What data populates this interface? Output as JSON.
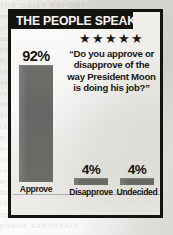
{
  "headline": "THE PEOPLE SPEAK",
  "rating": {
    "icon": "star-icon",
    "count": 5,
    "glyphs": "★★★★★"
  },
  "quote": "“Do you approve or disapprove of the way President Moon is doing his job?”",
  "colors": {
    "frame": "#15130f",
    "headline_bar": "#14120e",
    "headline_text": "#fbfaf7",
    "bar_fill": "#6a6a66",
    "paper": "#eceae6",
    "ink": "#17150f"
  },
  "bleed_lines": [
    "THE DAILY REPORT",
    "an  urgent  notice",
    "of  the  committee",
    "see  back  page  for",
    "continued  coverage",
    "NATIONAL  EDITION",
    "the  people  speak",
    "approval  ratings",
    "record  high  marks",
    "editorial  opinion",
    "city  desk  bulletin",
    "late  final  edition",
    "market  wrap  up",
    "weather  and  sports",
    "classified  section",
    "letters  to  editor",
    "world  news  digest",
    "business  section  b",
    "the  morning  news",
    "special  report  now",
    "public  confidence"
  ],
  "chart_data": {
    "type": "bar",
    "title": "THE PEOPLE SPEAK",
    "subtitle": "“Do you approve or disapprove of the way President Moon is doing his job?”",
    "xlabel": "",
    "ylabel": "",
    "ylim": [
      0,
      100
    ],
    "grid": false,
    "legend": "none",
    "unit": "%",
    "categories": [
      "Approve",
      "Disapprove",
      "Undecided"
    ],
    "values": [
      92,
      4,
      4
    ],
    "data_labels": [
      "92%",
      "4%",
      "4%"
    ],
    "bars": [
      {
        "label": "Approve",
        "value": 92,
        "display": "92%"
      },
      {
        "label": "Disapprove",
        "value": 4,
        "display": "4%"
      },
      {
        "label": "Undecided",
        "value": 4,
        "display": "4%"
      }
    ]
  }
}
